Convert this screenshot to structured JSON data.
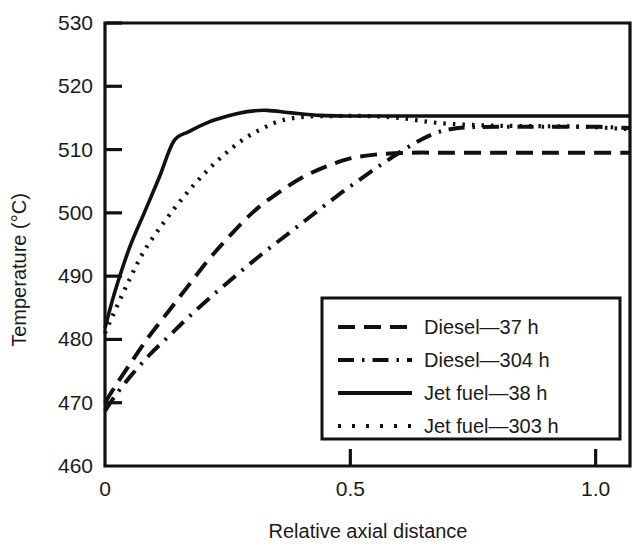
{
  "chart_data": {
    "type": "line",
    "title": "",
    "xlabel": "Relative axial distance",
    "ylabel": "Temperature (°C)",
    "xlim": [
      0,
      1.07
    ],
    "ylim": [
      460,
      530
    ],
    "xticks": [
      0,
      0.5,
      1.0
    ],
    "xtick_labels": [
      "0",
      "0.5",
      "1.0"
    ],
    "yticks": [
      460,
      470,
      480,
      490,
      500,
      510,
      520,
      530
    ],
    "ytick_labels": [
      "460",
      "470",
      "480",
      "490",
      "500",
      "510",
      "520",
      "530"
    ],
    "grid": false,
    "legend_position": "lower-right-inside",
    "series": [
      {
        "name": "Diesel—37 h",
        "style": "dashed",
        "x": [
          0.0,
          0.02,
          0.05,
          0.09,
          0.13,
          0.17,
          0.21,
          0.25,
          0.3,
          0.35,
          0.4,
          0.45,
          0.5,
          0.55,
          0.62,
          0.7,
          0.8,
          0.9,
          1.0,
          1.07
        ],
        "y": [
          470.0,
          472.5,
          476.0,
          480.5,
          484.5,
          488.5,
          492.5,
          496.0,
          500.0,
          503.0,
          505.5,
          507.3,
          508.6,
          509.2,
          509.5,
          509.5,
          509.5,
          509.5,
          509.5,
          509.5
        ]
      },
      {
        "name": "Diesel—304 h",
        "style": "dash-dot",
        "x": [
          0.0,
          0.02,
          0.05,
          0.09,
          0.13,
          0.17,
          0.22,
          0.27,
          0.32,
          0.37,
          0.42,
          0.47,
          0.52,
          0.57,
          0.62,
          0.67,
          0.72,
          0.8,
          0.9,
          1.0,
          1.07
        ],
        "y": [
          468.7,
          471.0,
          474.0,
          477.5,
          480.5,
          483.5,
          487.0,
          490.3,
          493.5,
          496.5,
          499.5,
          502.5,
          505.3,
          508.0,
          510.5,
          512.5,
          513.4,
          513.6,
          513.6,
          513.6,
          513.4
        ]
      },
      {
        "name": "Jet fuel—38 h",
        "style": "solid",
        "x": [
          0.0,
          0.02,
          0.05,
          0.08,
          0.11,
          0.14,
          0.17,
          0.21,
          0.25,
          0.29,
          0.33,
          0.38,
          0.44,
          0.5,
          0.58,
          0.65,
          0.75,
          0.85,
          0.95,
          1.05,
          1.07
        ],
        "y": [
          481.8,
          487.5,
          494.5,
          500.0,
          505.5,
          511.3,
          512.8,
          514.3,
          515.3,
          516.0,
          516.2,
          515.8,
          515.4,
          515.3,
          515.3,
          515.3,
          515.3,
          515.3,
          515.3,
          515.3,
          515.3
        ]
      },
      {
        "name": "Jet fuel—303 h",
        "style": "dotted",
        "x": [
          0.0,
          0.02,
          0.05,
          0.08,
          0.12,
          0.16,
          0.2,
          0.24,
          0.28,
          0.32,
          0.36,
          0.41,
          0.47,
          0.53,
          0.6,
          0.68,
          0.78,
          0.88,
          0.98,
          1.07
        ],
        "y": [
          481.0,
          484.5,
          489.5,
          494.0,
          498.5,
          502.5,
          506.0,
          509.0,
          511.5,
          513.3,
          514.6,
          515.2,
          515.3,
          515.3,
          515.0,
          514.2,
          513.8,
          513.7,
          513.6,
          513.2
        ]
      }
    ]
  },
  "legend": {
    "entries": [
      {
        "label": "Diesel—37 h",
        "style": "dashed"
      },
      {
        "label": "Diesel—304 h",
        "style": "dash-dot"
      },
      {
        "label": "Jet fuel—38 h",
        "style": "solid"
      },
      {
        "label": "Jet fuel—303 h",
        "style": "dotted"
      }
    ]
  },
  "colors": {
    "ink": "#111111",
    "background": "#ffffff"
  }
}
